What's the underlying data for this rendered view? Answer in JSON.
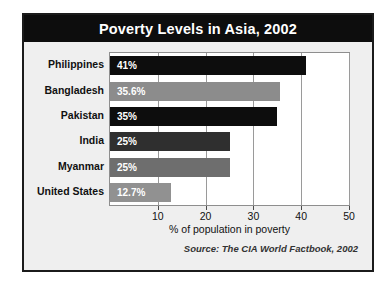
{
  "chart_data": {
    "type": "bar",
    "orientation": "horizontal",
    "title": "Poverty Levels in Asia, 2002",
    "xlabel": "% of population in poverty",
    "ylabel": "",
    "xlim": [
      0,
      50
    ],
    "xticks": [
      10,
      20,
      30,
      40,
      50
    ],
    "grid": true,
    "legend": false,
    "source": "Source: The CIA World Factbook, 2002",
    "categories": [
      "Philippines",
      "Bangladesh",
      "Pakistan",
      "India",
      "Myanmar",
      "United States"
    ],
    "values": [
      41,
      35.6,
      35,
      25,
      25,
      12.7
    ],
    "value_labels": [
      "41%",
      "35.6%",
      "35%",
      "25%",
      "25%",
      "12.7%"
    ],
    "bar_colors": [
      "#0d0d0d",
      "#8c8c8c",
      "#0d0d0d",
      "#2f2f2f",
      "#6e6e6e",
      "#919191"
    ]
  },
  "figure": {
    "background": "#efefef",
    "border_color": "#1b1b1b",
    "title_banner_color": "#0d0d0d",
    "title_text_color": "#ffffff",
    "plot_background": "#ffffff",
    "gridline_color": "#9a9a9a"
  }
}
